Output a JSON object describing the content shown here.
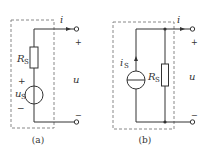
{
  "figure": {
    "panels": [
      {
        "id": "a",
        "caption": "(a)",
        "type": "voltage-source-model",
        "labels": {
          "current": "i",
          "resistor": "R",
          "resistor_sub": "S",
          "source": "u",
          "source_sub": "S",
          "source_plus": "+",
          "source_minus": "−",
          "terminal_plus": "+",
          "terminal_minus": "−",
          "voltage": "u"
        }
      },
      {
        "id": "b",
        "caption": "(b)",
        "type": "current-source-model",
        "labels": {
          "current": "i",
          "source": "i",
          "source_sub": "S",
          "resistor": "R",
          "resistor_sub": "S",
          "terminal_plus": "+",
          "terminal_minus": "−",
          "voltage": "u"
        }
      }
    ],
    "colors": {
      "line": "#333333",
      "dashed_box": "#888888"
    }
  }
}
